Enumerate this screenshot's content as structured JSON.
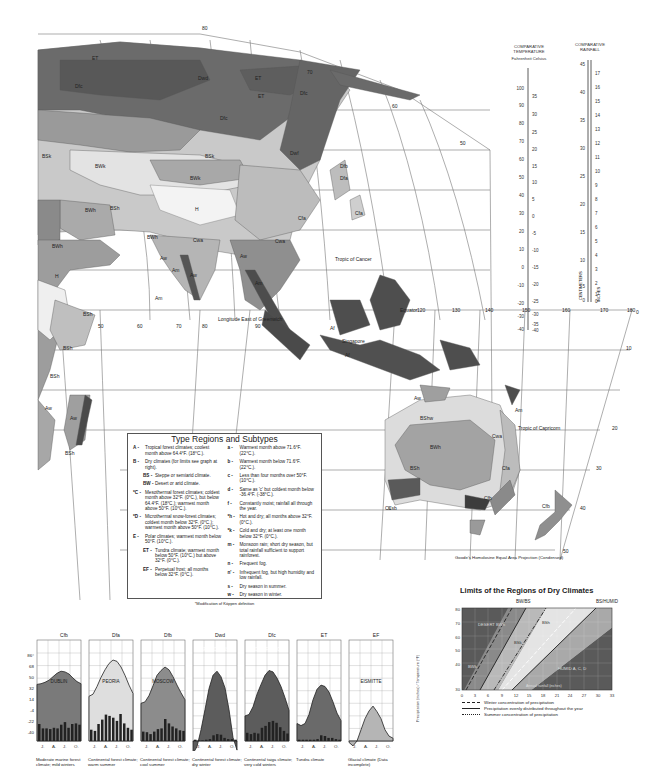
{
  "map": {
    "projection_caption": "Goode's Homolosine Equal Area Projection (Condensed)",
    "reference_lines": {
      "tropic_cancer": "Tropic of Cancer",
      "tropic_capricorn": "Tropic of Capricorn",
      "equator": "Equator",
      "longitude_note": "Longitude East of Greenwich"
    },
    "longitude_labels": [
      "50",
      "60",
      "70",
      "80",
      "90",
      "120",
      "130",
      "140",
      "150",
      "160",
      "170",
      "180"
    ],
    "latitude_labels_right": [
      "80",
      "70",
      "60",
      "50",
      "0",
      "10",
      "20",
      "30",
      "40",
      "50"
    ],
    "place_labels": [
      "Singapore"
    ],
    "region_codes": [
      "ET",
      "Dfc",
      "Dwd",
      "Dfb",
      "Dfa",
      "Dwf",
      "Cfb",
      "Cfa",
      "Cwa",
      "BSk",
      "BWk",
      "BSh",
      "BWh",
      "H",
      "Aw",
      "Am",
      "Af",
      "BShw",
      "Csb",
      "Cs"
    ]
  },
  "legend": {
    "title": "Type Regions and Subtypes",
    "left_items": [
      {
        "key": "A -",
        "text": "Tropical forest climates; coolest month above 64.4°F. (18°C.)."
      },
      {
        "key": "B -",
        "text": "Dry climates (for limits see graph at right)."
      },
      {
        "key": "BS -",
        "text": "Steppe or semiarid climate.",
        "sub": true
      },
      {
        "key": "BW -",
        "text": "Desert or arid climate.",
        "sub": true
      },
      {
        "key": "*C -",
        "text": "Mesothermal forest climates; coldest month above 32°F. (0°C.), but below 64.4°F. (18°C.); warmest month above 50°F. (10°C.)."
      },
      {
        "key": "*D -",
        "text": "Microthermal snow-forest climates; coldest month below 32°F. (0°C.); warmest month above 50°F. (10°C.)."
      },
      {
        "key": "E -",
        "text": "Polar climates; warmest month below 50°F. (10°C.)."
      },
      {
        "key": "ET -",
        "text": "Tundra climate; warmest month below 50°F. (10°C.) but above 32°F. (0°C.).",
        "sub": true
      },
      {
        "key": "EF -",
        "text": "Perpetual frost; all months below 32°F. (0°C.).",
        "sub": true
      }
    ],
    "right_items": [
      {
        "key": "a -",
        "text": "Warmest month above 71.6°F. (22°C.)."
      },
      {
        "key": "b -",
        "text": "Warmest month below 71.6°F. (22°C.)."
      },
      {
        "key": "c -",
        "text": "Less than four months over 50°F. (10°C.)."
      },
      {
        "key": "d -",
        "text": "Same as 'c' but coldest month below -36.4°F. (-38°C.)."
      },
      {
        "key": "f -",
        "text": "Constantly moist; rainfall all through the year."
      },
      {
        "key": "*h -",
        "text": "Hot and dry; all months above 32°F. (0°C.)."
      },
      {
        "key": "*k -",
        "text": "Cold and dry; at least one month below 32°F. (0°C.)."
      },
      {
        "key": "m -",
        "text": "Monsoon rain; short dry season, but total rainfall sufficient to support rainforest."
      },
      {
        "key": "n -",
        "text": "Frequent fog."
      },
      {
        "key": "n' -",
        "text": "Infrequent fog, but high humidity and low rainfall."
      },
      {
        "key": "s -",
        "text": "Dry season in summer."
      },
      {
        "key": "w -",
        "text": "Dry season in winter."
      }
    ],
    "footnote": "*Modification of Köppen definition"
  },
  "scales": {
    "temperature": {
      "title": "COMPARATIVE TEMPERATURE",
      "units_title": "Fahrenheit  Celsius",
      "fahrenheit_ticks": [
        "100",
        "90",
        "80",
        "70",
        "60",
        "50",
        "40",
        "30",
        "20",
        "10",
        "0",
        "-10",
        "-20",
        "-30",
        "-40"
      ],
      "celsius_ticks": [
        "35",
        "30",
        "25",
        "20",
        "15",
        "10",
        "5",
        "0",
        "-5",
        "-10",
        "-15",
        "-20",
        "-25",
        "-30",
        "-35",
        "-40"
      ]
    },
    "rainfall": {
      "title": "COMPARATIVE RAINFALL",
      "centimeter_ticks": [
        "45",
        "40",
        "35",
        "30",
        "25",
        "20",
        "15",
        "10",
        "5",
        "0"
      ],
      "inch_ticks": [
        "17",
        "16",
        "15",
        "14",
        "13",
        "12",
        "11",
        "10",
        "9",
        "8",
        "7",
        "6",
        "5",
        "4",
        "3",
        "2",
        "1",
        "0"
      ],
      "left_label": "CENTIMETERS",
      "right_label": "INCHES"
    }
  },
  "chart_data": [
    {
      "type": "area",
      "title": "Climographs (monthly temperature curve with monthly precipitation bars)",
      "y_ticks_left": [
        "86°",
        "68",
        "50",
        "32",
        "14",
        "-4",
        "-22",
        "-40"
      ],
      "y_ticks_right": [
        "14",
        "12",
        "10",
        "8",
        "6",
        "4",
        "2",
        "0"
      ],
      "right_axis_label": "Precipitation (inches) / Temperature (°F)",
      "x_ticks": [
        "J.",
        "A.",
        "J.",
        "O."
      ],
      "series": [
        {
          "code": "Cfb",
          "station": "DUBLIN",
          "caption": "Moderate marine forest climate; mild winters",
          "temp_f": [
            41,
            42,
            44,
            47,
            52,
            57,
            60,
            59,
            56,
            50,
            45,
            42
          ],
          "precip_in": [
            2.7,
            2.0,
            2.0,
            1.9,
            2.1,
            2.0,
            2.6,
            3.0,
            2.1,
            2.7,
            2.8,
            2.6
          ]
        },
        {
          "code": "Dfa",
          "station": "PEORIA",
          "caption": "Continental forest climate; warm summer",
          "temp_f": [
            24,
            27,
            38,
            51,
            62,
            71,
            76,
            74,
            66,
            54,
            40,
            28
          ],
          "precip_in": [
            1.8,
            1.6,
            2.7,
            3.4,
            4.2,
            4.0,
            3.7,
            3.2,
            4.3,
            2.8,
            2.1,
            1.8
          ]
        },
        {
          "code": "Dfb",
          "station": "MOSCOW",
          "caption": "Continental forest climate; cool summer",
          "temp_f": [
            14,
            16,
            25,
            39,
            54,
            61,
            66,
            62,
            52,
            40,
            29,
            19
          ],
          "precip_in": [
            1.5,
            1.4,
            1.1,
            1.5,
            1.9,
            2.0,
            3.5,
            2.8,
            2.3,
            2.0,
            1.7,
            1.6
          ]
        },
        {
          "code": "Dwd",
          "station": "VERKHOYANSK",
          "caption": "Continental forest climate; dry winter",
          "temp_f": [
            -58,
            -48,
            -24,
            5,
            35,
            54,
            60,
            52,
            36,
            5,
            -35,
            -53
          ],
          "precip_in": [
            0.2,
            0.1,
            0.1,
            0.2,
            0.3,
            0.9,
            1.1,
            1.0,
            0.5,
            0.3,
            0.3,
            0.2
          ]
        },
        {
          "code": "Dfc",
          "station": "MOOSE FACTORY",
          "caption": "Continental taiga climate; very cold winters",
          "temp_f": [
            -4,
            -2,
            9,
            27,
            41,
            54,
            61,
            59,
            50,
            38,
            22,
            4
          ],
          "precip_in": [
            1.3,
            1.1,
            1.3,
            1.2,
            2.1,
            2.4,
            3.0,
            3.2,
            2.9,
            2.2,
            1.6,
            1.2
          ]
        },
        {
          "code": "ET",
          "station": "BARROW",
          "caption": "Tundra climate",
          "temp_f": [
            -15,
            -18,
            -15,
            -2,
            19,
            34,
            40,
            38,
            30,
            16,
            0,
            -11
          ],
          "precip_in": [
            0.2,
            0.2,
            0.2,
            0.2,
            0.2,
            0.3,
            0.9,
            0.8,
            0.5,
            0.5,
            0.3,
            0.2
          ]
        },
        {
          "code": "EF",
          "station": "EISMITTE",
          "caption": "Glacial climate (Data incomplete)",
          "temp_f": [
            -42,
            -47,
            -40,
            -24,
            -8,
            3,
            10,
            2,
            -8,
            -24,
            -33,
            -36
          ],
          "precip_in": []
        }
      ]
    },
    {
      "type": "area",
      "title": "Limits of the Regions of Dry Climates",
      "xlabel": "Annual rainfall (inches)",
      "ylabel": "Mean annual temperature (°F)",
      "x_ticks": [
        "0",
        "3",
        "6",
        "9",
        "12",
        "15",
        "18",
        "21",
        "24",
        "27",
        "30",
        "33"
      ],
      "y_ticks": [
        "80",
        "70",
        "60",
        "50",
        "40",
        "30"
      ],
      "region_labels": [
        "DESERT BWh",
        "BWk",
        "BSh",
        "BSk",
        "HUMID A, C, D"
      ],
      "boundary_labels": [
        "BW/BS",
        "BS/HUMID"
      ],
      "right_side_label": "Annual temperature (°F)",
      "bottom_arrow_label": "Annual rainfall (inches)",
      "line_key": [
        {
          "style": "dashed",
          "label": "Winter concentration of precipitation"
        },
        {
          "style": "solid",
          "label": "Precipitation evenly distributed throughout the year"
        },
        {
          "style": "dash-dot",
          "label": "Summer concentration of precipitation"
        }
      ]
    }
  ]
}
